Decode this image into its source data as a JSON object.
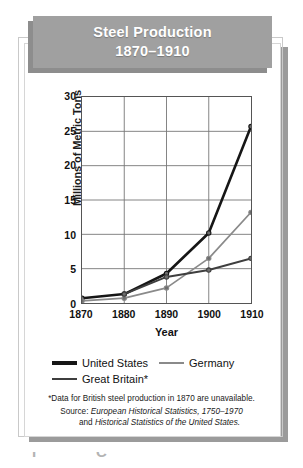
{
  "title": {
    "line1": "Steel Production",
    "line2": "1870–1910"
  },
  "axes": {
    "y_label": "Millions of Metric Tons",
    "x_label": "Year",
    "y_ticks": [
      "0",
      "5",
      "10",
      "15",
      "20",
      "25",
      "30"
    ],
    "x_ticks": [
      "1870",
      "1880",
      "1890",
      "1900",
      "1910"
    ]
  },
  "legend": {
    "items": [
      {
        "label": "United States",
        "color": "#161616",
        "key": "swatch-united-states"
      },
      {
        "label": "Germany",
        "color": "#8a8a8a",
        "key": "swatch-germany"
      },
      {
        "label": "Great Britain*",
        "color": "#3e3e3e",
        "key": "swatch-great-britain"
      }
    ]
  },
  "notes": {
    "footnote": "*Data for British steel production in 1870 are unavailable.",
    "source_prefix": "Source: ",
    "source_line1_italic": "European Historical Statistics, 1750–1970",
    "source_line2_plain": "and ",
    "source_line2_italic": "Historical Statistics of the United States."
  },
  "chart_data": {
    "type": "line",
    "title": "Steel Production 1870–1910",
    "xlabel": "Year",
    "ylabel": "Millions of Metric Tons",
    "x": [
      1870,
      1880,
      1890,
      1900,
      1910
    ],
    "categories": [
      "1870",
      "1880",
      "1890",
      "1900",
      "1910"
    ],
    "xlim": [
      1870,
      1910
    ],
    "ylim": [
      0,
      30
    ],
    "ytick_interval": 5,
    "grid": true,
    "legend_position": "below-plot",
    "units": "millions of metric tons",
    "series": [
      {
        "name": "United States",
        "color": "#161616",
        "line_width": 2.6,
        "marker": "circle",
        "values": [
          0.7,
          1.3,
          4.3,
          10.2,
          25.7
        ]
      },
      {
        "name": "Germany",
        "color": "#8a8a8a",
        "line_width": 1.7,
        "marker": "circle",
        "values": [
          0.3,
          0.7,
          2.2,
          6.5,
          13.2
        ]
      },
      {
        "name": "Great Britain*",
        "color": "#3e3e3e",
        "line_width": 2.0,
        "marker": "circle",
        "values": [
          null,
          1.3,
          3.8,
          4.8,
          6.5
        ],
        "note": "Data for British steel production in 1870 are unavailable."
      }
    ]
  },
  "bleed_text": "­  ­"
}
